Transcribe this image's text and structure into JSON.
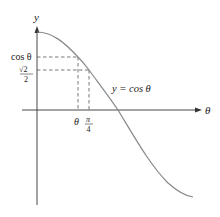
{
  "diagram": {
    "axes": {
      "x_label": "θ",
      "y_label": "y"
    },
    "curve": {
      "label": "y = cos θ",
      "function": "cos"
    },
    "y_marks": [
      {
        "id": "cos_theta",
        "label": "cos θ"
      },
      {
        "id": "sqrt2_over_2",
        "numerator": "√2",
        "denominator": "2"
      }
    ],
    "x_marks": [
      {
        "id": "theta",
        "label": "θ"
      },
      {
        "id": "pi_over_4",
        "numerator": "π",
        "denominator": "4"
      }
    ],
    "colors": {
      "axis": "#333333",
      "curve": "#888888",
      "dashed": "#555555",
      "text": "#222222"
    }
  }
}
